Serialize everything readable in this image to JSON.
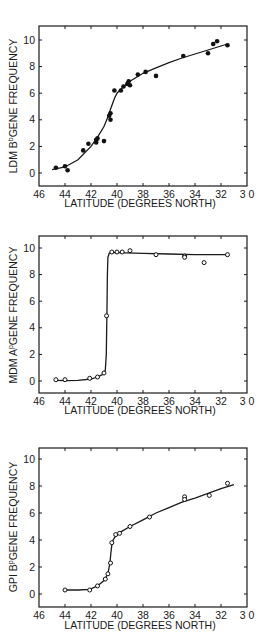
{
  "chart_data": [
    {
      "type": "scatter",
      "title": "",
      "xlabel": "LATITUDE (DEGREES NORTH)",
      "ylabel": "LDM B^b GENE FREQUENCY",
      "ylabel_parts": {
        "prefix": "LDM B",
        "sup": "b",
        "suffix": "GENE FREQUENCY"
      },
      "xlim": [
        46,
        30
      ],
      "ylim": [
        -1,
        11
      ],
      "xticks": [
        46,
        44,
        42,
        40,
        38,
        36,
        34,
        32,
        30
      ],
      "xtick_labels": [
        "46",
        "44",
        "42",
        "40",
        "38",
        "36",
        "34",
        "32",
        "3 0"
      ],
      "yticks": [
        0,
        2,
        4,
        6,
        8,
        10
      ],
      "marker": "filled",
      "grid": false,
      "legend": null,
      "points": {
        "x": [
          44.7,
          44.0,
          43.8,
          42.6,
          42.2,
          41.6,
          41.6,
          41.5,
          41.0,
          40.6,
          40.5,
          40.5,
          40.2,
          39.7,
          39.5,
          39.2,
          39.1,
          39.0,
          38.4,
          37.8,
          37.0,
          34.9,
          33.0,
          32.6,
          32.3,
          31.5
        ],
        "y": [
          0.4,
          0.5,
          0.2,
          1.7,
          2.2,
          2.3,
          2.5,
          2.6,
          2.4,
          4.3,
          4.0,
          4.5,
          6.2,
          6.2,
          6.5,
          6.7,
          6.9,
          6.6,
          7.4,
          7.6,
          7.3,
          8.8,
          9.0,
          9.7,
          9.9,
          9.6
        ]
      },
      "curve": {
        "x": [
          45.0,
          44.0,
          43.0,
          42.0,
          41.5,
          41.0,
          40.7,
          40.5,
          40.2,
          40.0,
          39.5,
          39.0,
          38.0,
          37.0,
          36.0,
          35.0,
          34.0,
          33.0,
          32.0,
          31.5
        ],
        "y": [
          0.25,
          0.45,
          1.0,
          2.0,
          2.7,
          3.5,
          4.2,
          4.8,
          5.6,
          6.0,
          6.5,
          6.9,
          7.5,
          7.9,
          8.3,
          8.65,
          8.95,
          9.25,
          9.55,
          9.7
        ]
      }
    },
    {
      "type": "scatter",
      "title": "",
      "xlabel": "LATITUDE (DEGREES NORTH)",
      "ylabel": "MDM A^p GENE FREQUENCY",
      "ylabel_parts": {
        "prefix": "MDM A",
        "sup": "p",
        "suffix": "GENE FREQUENCY"
      },
      "xlim": [
        46,
        30
      ],
      "ylim": [
        -1,
        11
      ],
      "xticks": [
        46,
        44,
        42,
        40,
        38,
        36,
        34,
        32,
        30
      ],
      "xtick_labels": [
        "46",
        "44",
        "42",
        "40",
        "38",
        "36",
        "34",
        "32",
        "3 0"
      ],
      "yticks": [
        0,
        2,
        4,
        6,
        8,
        10
      ],
      "marker": "open",
      "grid": false,
      "legend": null,
      "points": {
        "x": [
          44.7,
          44.0,
          42.1,
          41.5,
          41.0,
          40.8,
          40.4,
          40.0,
          39.6,
          39.0,
          37.0,
          34.8,
          34.8,
          33.3,
          31.5
        ],
        "y": [
          0.1,
          0.1,
          0.2,
          0.3,
          0.6,
          4.9,
          9.7,
          9.7,
          9.7,
          9.8,
          9.5,
          9.4,
          9.3,
          8.9,
          9.5
        ]
      },
      "curve": {
        "x": [
          44.7,
          44.0,
          43.0,
          42.0,
          41.5,
          41.1,
          40.9,
          40.82,
          40.78,
          40.74,
          40.7,
          40.6,
          40.4,
          40.0,
          38.0,
          36.0,
          34.0,
          32.0,
          31.5
        ],
        "y": [
          0.05,
          0.02,
          0.05,
          0.15,
          0.3,
          0.5,
          0.8,
          2.0,
          5.0,
          8.0,
          9.3,
          9.6,
          9.65,
          9.65,
          9.6,
          9.55,
          9.5,
          9.5,
          9.5
        ]
      }
    },
    {
      "type": "scatter",
      "title": "",
      "xlabel": "LATITUDE (DEGREES NORTH)",
      "ylabel": "GPI B^p GENE FREQUENCY",
      "ylabel_parts": {
        "prefix": "GPI B",
        "sup": "p",
        "suffix": "GENE FREQUENCY"
      },
      "xlim": [
        46,
        30
      ],
      "ylim": [
        -1,
        11
      ],
      "xticks": [
        46,
        44,
        42,
        40,
        38,
        36,
        34,
        32,
        30
      ],
      "xtick_labels": [
        "46",
        "44",
        "42",
        "40",
        "38",
        "36",
        "34",
        "32",
        "3 0"
      ],
      "yticks": [
        0,
        2,
        4,
        6,
        8,
        10
      ],
      "marker": "open",
      "grid": false,
      "legend": null,
      "points": {
        "x": [
          44.0,
          42.1,
          41.5,
          40.9,
          40.7,
          40.5,
          40.4,
          40.1,
          39.8,
          39.0,
          37.5,
          34.8,
          34.8,
          32.9,
          31.5
        ],
        "y": [
          0.3,
          0.3,
          0.6,
          1.1,
          1.5,
          2.3,
          3.8,
          4.4,
          4.5,
          5.0,
          5.7,
          7.2,
          7.0,
          7.3,
          8.2
        ]
      },
      "curve": {
        "x": [
          44.0,
          43.0,
          42.1,
          41.5,
          41.0,
          40.7,
          40.55,
          40.45,
          40.4,
          40.3,
          40.1,
          39.8,
          39.0,
          38.0,
          37.0,
          36.0,
          35.0,
          34.0,
          33.0,
          32.0,
          31.0
        ],
        "y": [
          0.3,
          0.3,
          0.35,
          0.6,
          1.0,
          1.5,
          2.3,
          3.2,
          3.6,
          4.0,
          4.3,
          4.55,
          5.0,
          5.5,
          6.0,
          6.4,
          6.8,
          7.1,
          7.45,
          7.8,
          8.1
        ]
      }
    }
  ]
}
